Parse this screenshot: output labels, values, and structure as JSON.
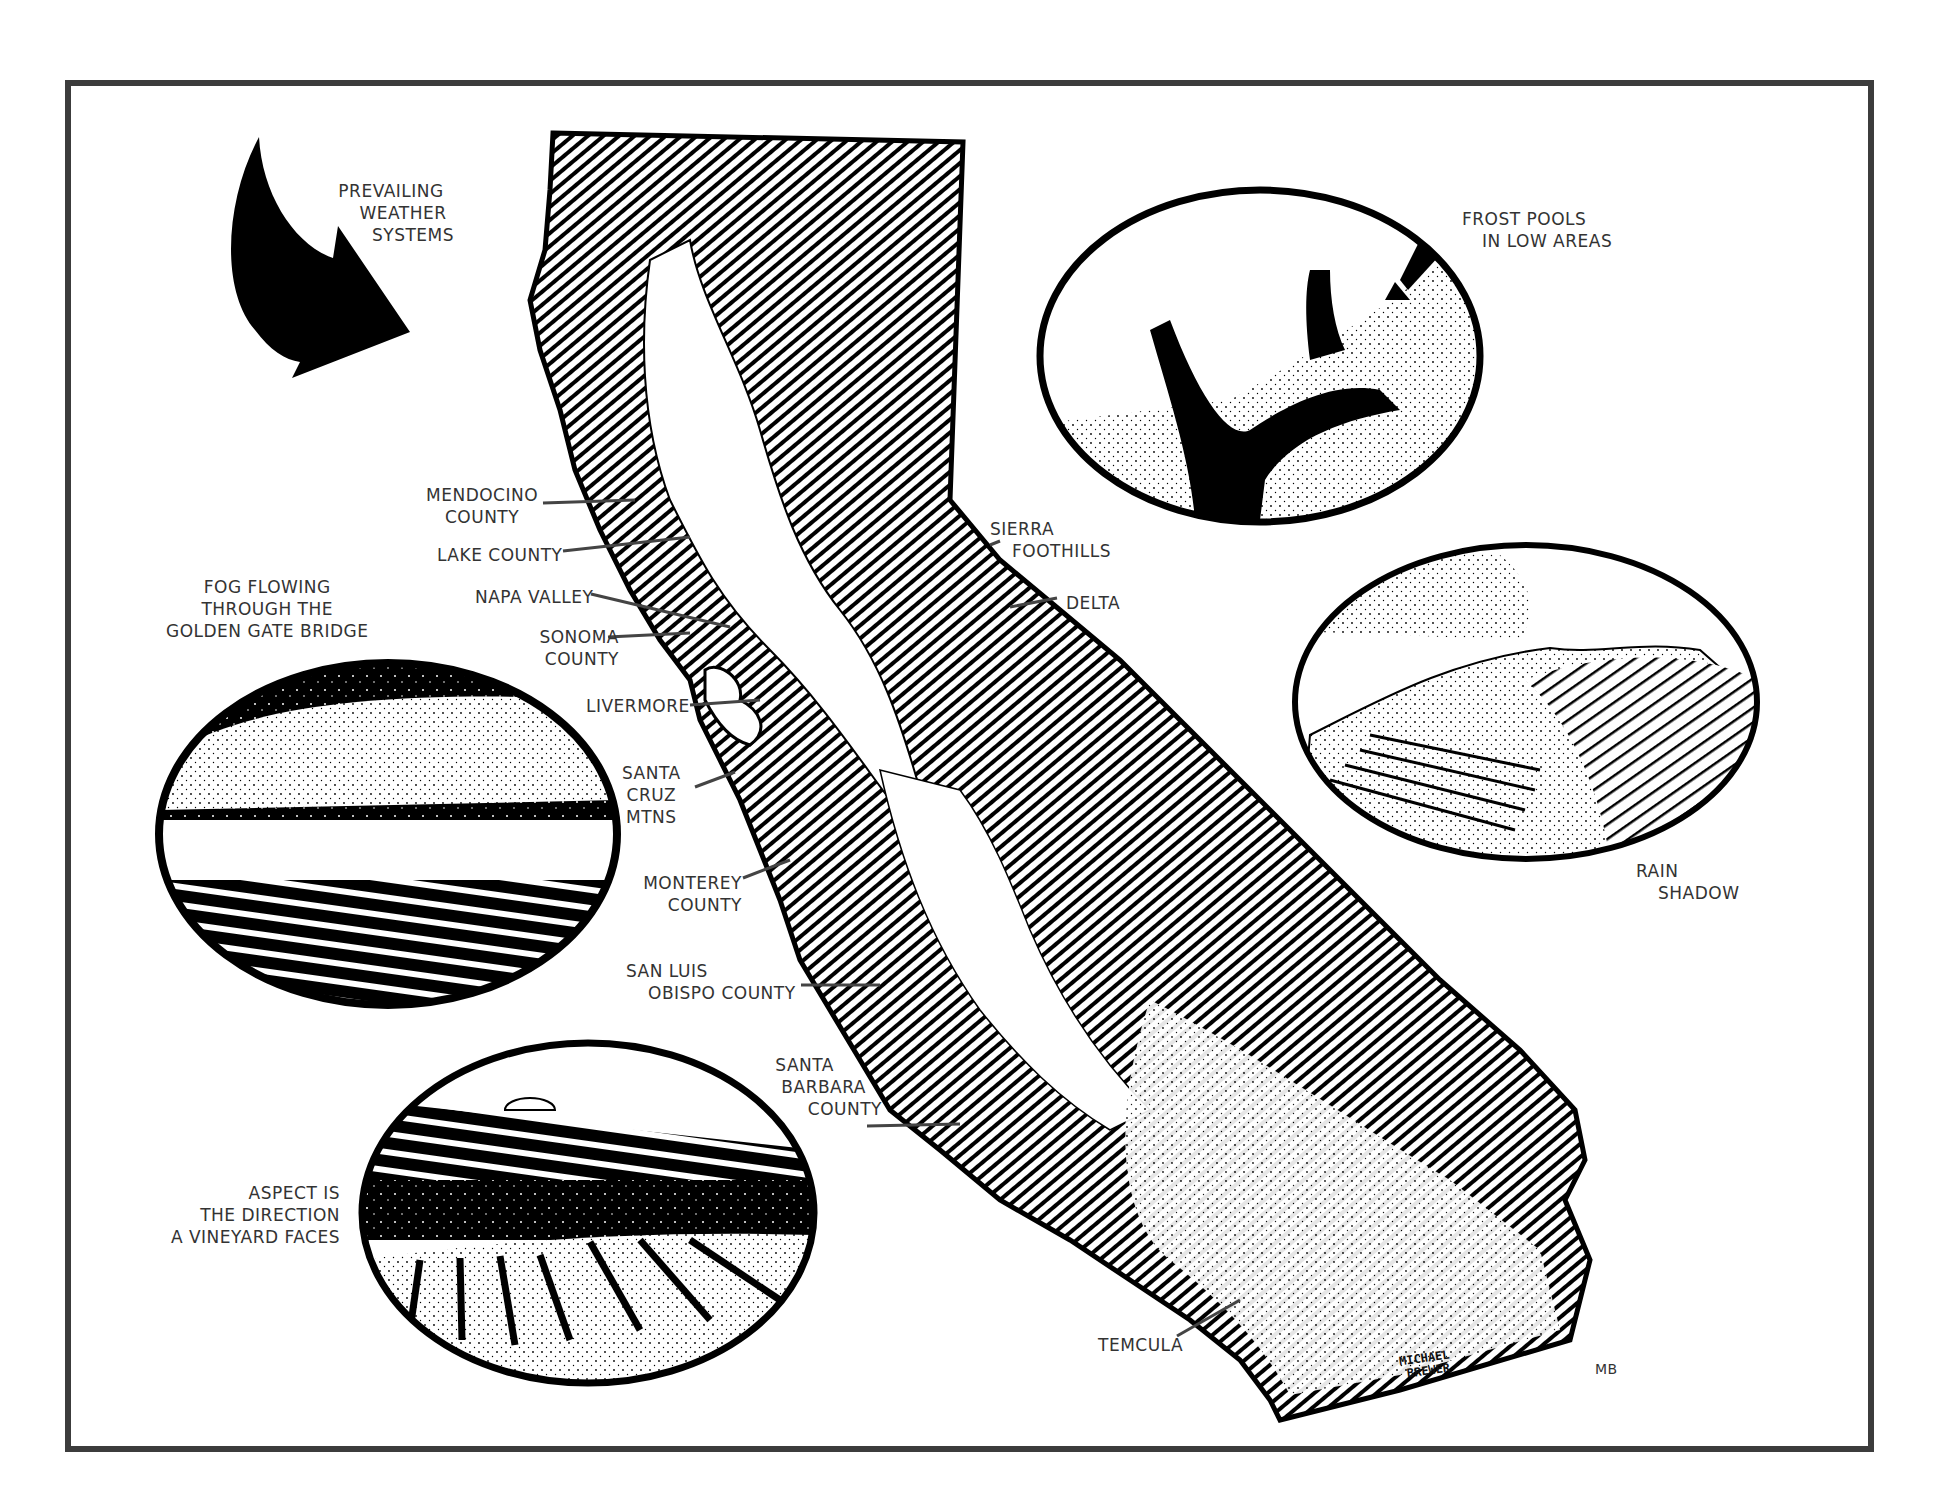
{
  "map": {
    "subject": "California wine regions and climate influences",
    "prevailing_weather": {
      "lines": [
        "PREVAILING",
        "WEATHER",
        "SYSTEMS"
      ],
      "icon": "curved-arrow-icon"
    },
    "vignettes": {
      "frost": {
        "lines": [
          "FROST POOLS",
          "IN LOW AREAS"
        ]
      },
      "rain_shadow": {
        "lines": [
          "RAIN",
          "SHADOW"
        ]
      },
      "fog": {
        "lines": [
          "FOG FLOWING",
          "THROUGH THE",
          "GOLDEN GATE BRIDGE"
        ]
      },
      "aspect": {
        "lines": [
          "ASPECT IS",
          "THE DIRECTION",
          "A VINEYARD FACES"
        ]
      }
    },
    "regions": {
      "mendocino": [
        "MENDOCINO",
        "COUNTY"
      ],
      "lake": [
        "LAKE COUNTY"
      ],
      "napa": [
        "NAPA VALLEY"
      ],
      "sonoma": [
        "SONOMA",
        "COUNTY"
      ],
      "livermore": [
        "LIVERMORE"
      ],
      "santa_cruz": [
        "SANTA",
        "CRUZ",
        "MTNS"
      ],
      "monterey": [
        "MONTEREY",
        "COUNTY"
      ],
      "san_luis_obispo": [
        "SAN LUIS",
        "OBISPO COUNTY"
      ],
      "santa_barbara": [
        "SANTA",
        "BARBARA",
        "COUNTY"
      ],
      "temecula": [
        "TEMCULA"
      ],
      "sierra_foothills": [
        "SIERRA",
        "FOOTHILLS"
      ],
      "delta": [
        "DELTA"
      ]
    },
    "signature": {
      "artist": [
        "MICHAEL",
        "BREWER"
      ],
      "initials": "MB"
    },
    "colors": {
      "ink": "#000000",
      "frame": "#3c3c3c",
      "paper": "#ffffff",
      "text": "#333333"
    }
  }
}
